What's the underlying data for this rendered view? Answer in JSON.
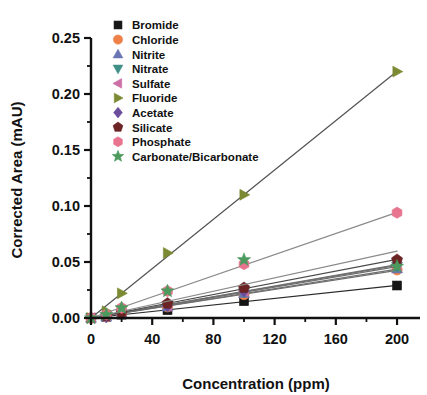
{
  "chart_data": {
    "type": "scatter",
    "title": "",
    "xlabel": "Concentration (ppm)",
    "ylabel": "Corrected Area (mAU)",
    "xlim": [
      0,
      215
    ],
    "ylim": [
      0.0,
      0.25
    ],
    "xticks": [
      0,
      40,
      80,
      120,
      160,
      200
    ],
    "xtick_labels": [
      "0",
      "40",
      "80",
      "120",
      "160",
      "200"
    ],
    "xminor_step": 20,
    "yticks": [
      0.0,
      0.05,
      0.1,
      0.15,
      0.2,
      0.25
    ],
    "ytick_labels": [
      "0.00",
      "0.05",
      "0.10",
      "0.15",
      "0.20",
      "0.25"
    ],
    "yminor_step": 0.025,
    "grid": false,
    "legend_position": "upper-left-inside",
    "x": [
      0,
      10,
      20,
      50,
      100,
      200
    ],
    "series": [
      {
        "name": "Bromide",
        "marker": "square",
        "color": "#161616",
        "line_color": "#2b2b2b",
        "values": [
          0.0,
          0.001,
          0.003,
          0.007,
          0.015,
          0.029
        ]
      },
      {
        "name": "Chloride",
        "marker": "circle",
        "color": "#ef8048",
        "line_color": "#6e6e6e",
        "values": [
          0.0,
          0.001,
          0.004,
          0.01,
          0.021,
          0.043
        ]
      },
      {
        "name": "Nitrite",
        "marker": "triangle-up",
        "color": "#6a76b4",
        "line_color": "#6e6e6e",
        "values": [
          0.0,
          0.001,
          0.004,
          0.01,
          0.022,
          0.044
        ]
      },
      {
        "name": "Nitrate",
        "marker": "triangle-down",
        "color": "#3f8f86",
        "line_color": "#6e6e6e",
        "values": [
          0.0,
          0.001,
          0.004,
          0.011,
          0.023,
          0.046
        ]
      },
      {
        "name": "Sulfate",
        "marker": "triangle-left",
        "color": "#cb6fa5",
        "line_color": "#6e6e6e",
        "values": [
          0.0,
          0.002,
          0.004,
          0.011,
          0.024,
          0.047
        ]
      },
      {
        "name": "Fluoride",
        "marker": "triangle-right",
        "color": "#7b8a33",
        "line_color": "#555555",
        "values": [
          0.0,
          0.006,
          0.022,
          0.058,
          0.11,
          0.22
        ]
      },
      {
        "name": "Acetate",
        "marker": "diamond",
        "color": "#6b4d9c",
        "line_color": "#6e6e6e",
        "values": [
          0.0,
          0.001,
          0.004,
          0.011,
          0.024,
          0.048
        ]
      },
      {
        "name": "Silicate",
        "marker": "pentagon",
        "color": "#6b2323",
        "line_color": "#4a4a4a",
        "values": [
          0.0,
          0.002,
          0.005,
          0.013,
          0.027,
          0.052
        ]
      },
      {
        "name": "Phosphate",
        "marker": "hexagon",
        "color": "#e8748f",
        "line_color": "#8a8a8a",
        "values": [
          0.0,
          0.003,
          0.009,
          0.024,
          0.048,
          0.094
        ]
      },
      {
        "name": "Carbonate/Bicarbonate",
        "marker": "star",
        "color": "#4c9a5e",
        "line_color": "#8a8a8a",
        "values": [
          0.0,
          0.003,
          0.009,
          0.024,
          0.052,
          0.046
        ]
      }
    ]
  },
  "axes": {
    "x_title": "Concentration (ppm)",
    "y_title": "Corrected Area (mAU)"
  },
  "legend": {
    "items": [
      {
        "label": "Bromide"
      },
      {
        "label": "Chloride"
      },
      {
        "label": "Nitrite"
      },
      {
        "label": "Nitrate"
      },
      {
        "label": "Sulfate"
      },
      {
        "label": "Fluoride"
      },
      {
        "label": "Acetate"
      },
      {
        "label": "Silicate"
      },
      {
        "label": "Phosphate"
      },
      {
        "label": "Carbonate/Bicarbonate"
      }
    ]
  }
}
